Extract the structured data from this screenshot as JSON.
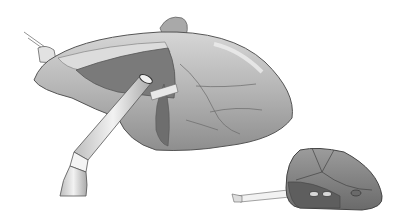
{
  "image": {
    "kind": "grayscale surgical illustration",
    "subjects": [
      {
        "name": "heart-with-cannula",
        "description": "Large organ (heart) with a sutured vessel at left, a darker incised region, and a straight cannula tube inserted from lower-left"
      },
      {
        "name": "pump-device",
        "description": "Small rounded implantable device at lower right with segmented panels, two ports and an attached lead"
      }
    ],
    "colors": {
      "background": "#ffffff",
      "organ_light": "#c8c8c8",
      "organ_mid": "#9a9a9a",
      "organ_dark": "#6e6e6e",
      "outline": "#555555",
      "tube": "#e6e6e6"
    }
  }
}
